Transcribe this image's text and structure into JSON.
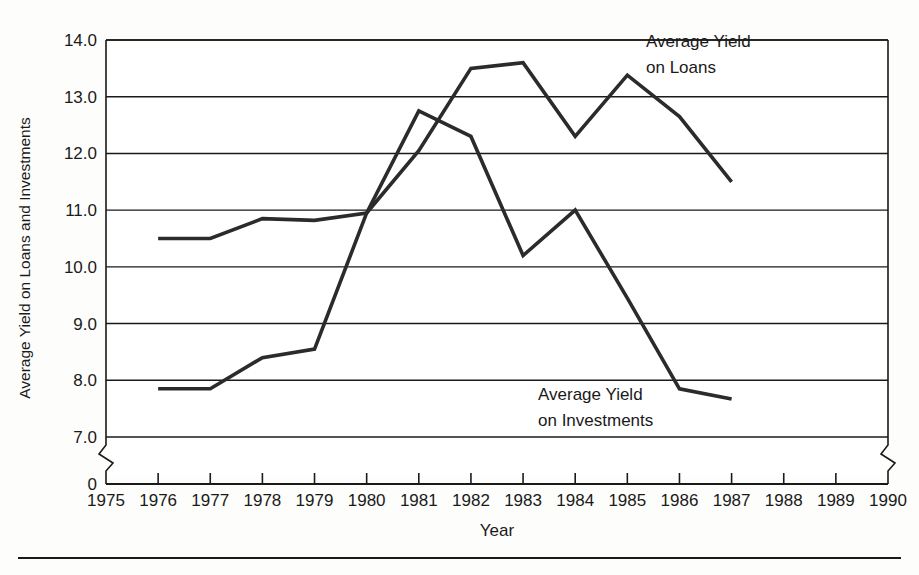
{
  "chart_data": {
    "type": "line",
    "title": "",
    "xlabel": "Year",
    "ylabel": "Average Yield on Loans and Investments",
    "x": [
      1976,
      1977,
      1978,
      1979,
      1980,
      1981,
      1982,
      1983,
      1984,
      1985,
      1986,
      1987
    ],
    "xlim": [
      1975,
      1990
    ],
    "ylim": [
      7.0,
      14.0
    ],
    "y_axis_break": true,
    "y_break_label": "0",
    "x_axis_break": true,
    "grid": "horizontal",
    "legend": "annotations-inline",
    "xticks": [
      "1975",
      "1976",
      "1977",
      "1978",
      "1979",
      "1980",
      "1981",
      "1982",
      "1983",
      "1984",
      "1985",
      "1986",
      "1987",
      "1988",
      "1989",
      "1990"
    ],
    "yticks": [
      "7.0",
      "8.0",
      "9.0",
      "10.0",
      "11.0",
      "12.0",
      "13.0",
      "14.0"
    ],
    "series": [
      {
        "name": "Average Yield on Loans",
        "annotation_line1": "Average Yield",
        "annotation_line2": "on Loans",
        "color": "#2b2b2b",
        "values": [
          10.5,
          10.5,
          10.85,
          10.82,
          10.95,
          12.05,
          13.5,
          13.6,
          12.3,
          13.38,
          12.65,
          11.5
        ]
      },
      {
        "name": "Average Yield on Investments",
        "annotation_line1": "Average Yield",
        "annotation_line2": "on Investments",
        "color": "#2b2b2b",
        "values": [
          7.85,
          7.85,
          8.4,
          8.55,
          10.95,
          12.75,
          12.3,
          10.2,
          11.0,
          9.45,
          7.85,
          7.67
        ]
      }
    ]
  },
  "axis": {
    "y_title": "Average Yield on Loans and Investments",
    "x_title": "Year"
  }
}
